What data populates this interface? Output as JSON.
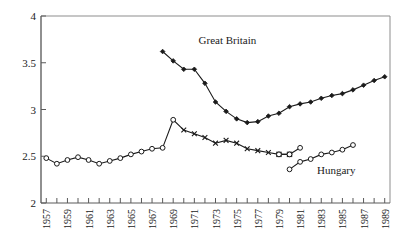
{
  "chart_data": {
    "type": "line",
    "title": "",
    "subtitle": "",
    "xlabel": "",
    "ylabel": "",
    "xlim": [
      1956.5,
      1989.5
    ],
    "ylim": [
      2,
      4
    ],
    "yticks": [
      2,
      2.5,
      3,
      3.5,
      4
    ],
    "ytick_labels": [
      "2",
      "2.5",
      "3",
      "3.5",
      "4"
    ],
    "xticks": [
      1957,
      1958,
      1959,
      1960,
      1961,
      1962,
      1963,
      1964,
      1965,
      1966,
      1967,
      1968,
      1969,
      1970,
      1971,
      1972,
      1973,
      1974,
      1975,
      1976,
      1977,
      1978,
      1979,
      1980,
      1981,
      1982,
      1983,
      1984,
      1985,
      1986,
      1987,
      1988,
      1989
    ],
    "xtick_labels": [
      "1957",
      "1959",
      "1961",
      "1963",
      "1965",
      "1967",
      "1969",
      "1971",
      "1973",
      "1975",
      "1977",
      "1979",
      "1981",
      "1983",
      "1985",
      "1987",
      "1989"
    ],
    "xtick_labeled_years": [
      1957,
      1959,
      1961,
      1963,
      1965,
      1967,
      1969,
      1971,
      1973,
      1975,
      1977,
      1979,
      1981,
      1983,
      1985,
      1987,
      1989
    ],
    "grid": false,
    "legend_position": "inline-annotation",
    "series": [
      {
        "name": "Great Britain",
        "marker": "filled-diamond",
        "label_x": 1971.4,
        "label_y": 3.7,
        "x": [
          1968,
          1969,
          1970,
          1971,
          1972,
          1973,
          1974,
          1975,
          1976,
          1977,
          1978,
          1979,
          1980,
          1981,
          1982,
          1983,
          1984,
          1985,
          1986,
          1987,
          1988,
          1989
        ],
        "y": [
          3.62,
          3.52,
          3.43,
          3.43,
          3.28,
          3.08,
          2.98,
          2.9,
          2.86,
          2.87,
          2.93,
          2.96,
          3.03,
          3.06,
          3.08,
          3.12,
          3.15,
          3.17,
          3.21,
          3.26,
          3.31,
          3.35
        ]
      },
      {
        "name": "Hungary",
        "marker": "open-circle-cross",
        "label_x": 1982.4,
        "label_y": 2.31,
        "x": [
          1957,
          1958,
          1959,
          1960,
          1961,
          1962,
          1963,
          1964,
          1965,
          1966,
          1967,
          1968,
          1969,
          1970,
          1971,
          1972,
          1973,
          1974,
          1975,
          1976,
          1977,
          1978,
          1979,
          1980
        ],
        "y": [
          2.48,
          2.42,
          2.46,
          2.49,
          2.46,
          2.42,
          2.45,
          2.48,
          2.52,
          2.55,
          2.58,
          2.59,
          2.89,
          2.78,
          2.74,
          2.7,
          2.64,
          2.67,
          2.64,
          2.58,
          2.56,
          2.54,
          2.52,
          2.52
        ]
      },
      {
        "name": "Hungary-lower",
        "marker": "open-circle",
        "x": [
          1980,
          1981,
          1982,
          1983,
          1984,
          1985,
          1986
        ],
        "y": [
          2.36,
          2.44,
          2.47,
          2.52,
          2.54,
          2.57,
          2.62
        ]
      },
      {
        "name": "Hungary-upper-tail",
        "marker": "open-circle",
        "x": [
          1979,
          1980,
          1981
        ],
        "y": [
          2.52,
          2.52,
          2.59
        ]
      }
    ],
    "annotations": [
      {
        "text": "Great Britain",
        "x": 1971.4,
        "y": 3.7
      },
      {
        "text": "Hungary",
        "x": 1982.6,
        "y": 2.31
      }
    ]
  },
  "labels": {
    "great_britain": "Great Britain",
    "hungary": "Hungary"
  }
}
